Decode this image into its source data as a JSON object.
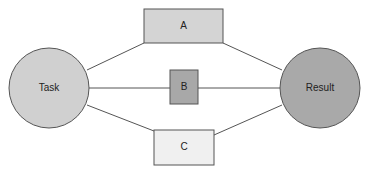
{
  "diagram": {
    "type": "flow",
    "nodes": [
      {
        "id": "task",
        "label": "Task",
        "shape": "circle",
        "fill": "#d0d0d0"
      },
      {
        "id": "a",
        "label": "A",
        "shape": "rect",
        "fill": "#d4d4d4"
      },
      {
        "id": "b",
        "label": "B",
        "shape": "rect",
        "fill": "#a8a8a8"
      },
      {
        "id": "c",
        "label": "C",
        "shape": "rect",
        "fill": "#f0f0f0"
      },
      {
        "id": "result",
        "label": "Result",
        "shape": "circle",
        "fill": "#a9a9a9"
      }
    ],
    "edges": [
      {
        "from": "task",
        "to": "a"
      },
      {
        "from": "task",
        "to": "b"
      },
      {
        "from": "task",
        "to": "c"
      },
      {
        "from": "a",
        "to": "result"
      },
      {
        "from": "b",
        "to": "result"
      },
      {
        "from": "c",
        "to": "result"
      }
    ],
    "colors": {
      "stroke": "#555555",
      "text": "#222222"
    }
  }
}
